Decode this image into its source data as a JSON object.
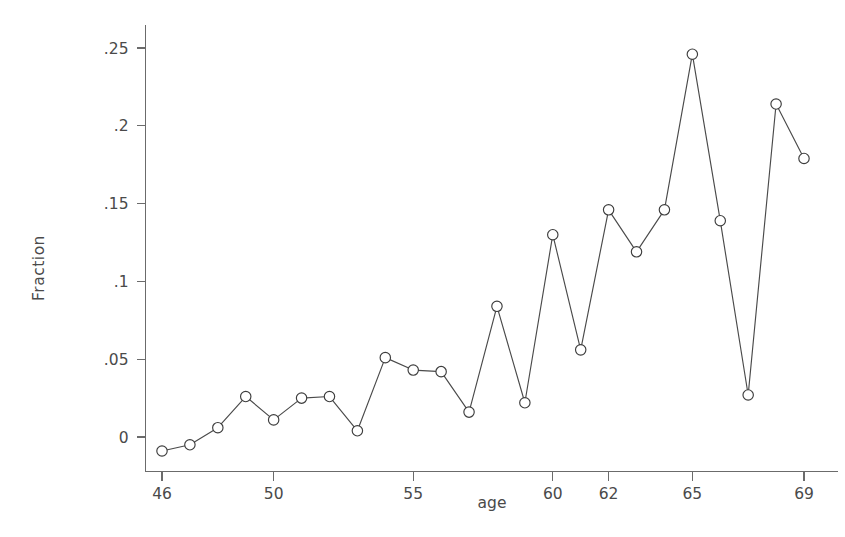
{
  "chart_data": {
    "type": "line",
    "title": "",
    "subtitle": "",
    "xlabel": "age",
    "ylabel": "Fraction",
    "x": [
      46,
      47,
      48,
      49,
      50,
      51,
      52,
      53,
      54,
      55,
      56,
      57,
      58,
      59,
      60,
      61,
      62,
      63,
      64,
      65,
      66,
      67,
      68,
      69
    ],
    "values": [
      -0.009,
      -0.005,
      0.006,
      0.026,
      0.011,
      0.025,
      0.026,
      0.004,
      0.051,
      0.043,
      0.042,
      0.016,
      0.084,
      0.022,
      0.13,
      0.056,
      0.146,
      0.119,
      0.146,
      0.246,
      0.139,
      0.027,
      0.214,
      0.179
    ],
    "series": [
      {
        "name": "Fraction",
        "values": [
          -0.009,
          -0.005,
          0.006,
          0.026,
          0.011,
          0.025,
          0.026,
          0.004,
          0.051,
          0.043,
          0.042,
          0.016,
          0.084,
          0.022,
          0.13,
          0.056,
          0.146,
          0.119,
          0.146,
          0.246,
          0.139,
          0.027,
          0.214,
          0.179
        ]
      }
    ],
    "xlim": [
      45.4,
      70.6
    ],
    "ylim": [
      -0.018,
      0.262
    ],
    "x_ticks": [
      46,
      50,
      55,
      60,
      62,
      65,
      69
    ],
    "x_tick_labels": [
      "46",
      "50",
      "55",
      "60",
      "62",
      "65",
      "69"
    ],
    "y_ticks": [
      0,
      0.05,
      0.1,
      0.15,
      0.2,
      0.25
    ],
    "y_tick_labels": [
      "0",
      ".05",
      ".1",
      ".15",
      ".2",
      ".25"
    ],
    "grid": false,
    "legend": false,
    "legend_position": "none",
    "marker": "circle-open",
    "line_color": "#4a4a4a",
    "marker_face_color": "#ffffff",
    "marker_edge_color": "#3d3d3d",
    "background_color": "#ffffff",
    "annotations": []
  },
  "axes": {
    "x_axis_name": "age-axis",
    "y_axis_name": "fraction-axis"
  }
}
